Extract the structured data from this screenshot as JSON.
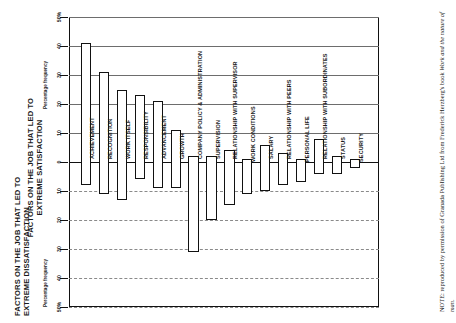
{
  "titles": {
    "dissatisfaction": "FACTORS ON THE JOB THAT LED TO\nEXTREME DISSATISFACTION",
    "satisfaction": "FACTORS ON THE JOB THAT LED TO\nEXTREME SATISFACTION"
  },
  "note": {
    "prefix": "NOTE:  reproduced by permission of Granada Publishing Ltd from Frederick Herzberg's book ",
    "book": "Work and the nature of man",
    "suffix": "."
  },
  "axis": {
    "name_top": "Percentage frequency",
    "name_bottom": "Percentage frequency",
    "ticks": [
      "50%",
      "40",
      "30",
      "20",
      "10",
      "0",
      "10",
      "20",
      "30",
      "40",
      "50%"
    ]
  },
  "chart_data": {
    "type": "bar",
    "xlabel": "",
    "ylabel": "Percentage frequency",
    "ylim": [
      -50,
      50
    ],
    "grid": true,
    "legend": "none",
    "orientation": "rotated-90",
    "groups": [
      {
        "name": "FACTORS ON THE JOB THAT LED TO EXTREME SATISFACTION",
        "categories": [
          "ACHIEVEMENT",
          "RECOGNITION",
          "WORK ITSELF",
          "RESPONSIBILITY",
          "ADVANCEMENT",
          "GROWTH"
        ],
        "satisfaction_values": [
          41,
          31,
          25,
          23,
          21,
          11
        ],
        "dissatisfaction_values": [
          -8,
          -11,
          -13,
          -6,
          -9,
          -9
        ]
      },
      {
        "name": "FACTORS ON THE JOB THAT LED TO EXTREME DISSATISFACTION",
        "categories": [
          "COMPANY POLICY & ADMINISTRATION",
          "SUPERVISION",
          "RELATIONSHIP WITH SUPERVISOR",
          "WORK CONDITIONS",
          "SALARY",
          "RELATIONSHIP WITH PEERS",
          "PERSONAL LIFE",
          "RELATIONSHIP WITH SUBORDINATES",
          "STATUS",
          "SECURITY"
        ],
        "satisfaction_values": [
          2,
          2,
          4,
          1,
          6,
          3,
          1,
          8,
          2,
          1
        ],
        "dissatisfaction_values": [
          -31,
          -20,
          -15,
          -11,
          -10,
          -8,
          -7,
          -4,
          -4,
          -2
        ]
      }
    ]
  }
}
